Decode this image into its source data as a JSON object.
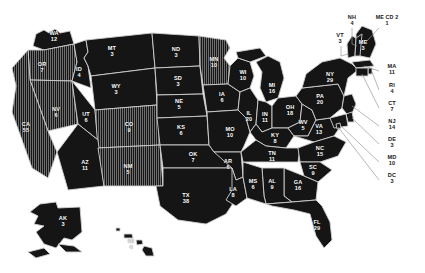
{
  "map": {
    "title": "United States Electoral College Map",
    "background_color": "#ffffff",
    "state_fill_solid": "#151515",
    "state_fill_hatched": "#4a4a4a",
    "state_border_color": "#cfcfcf",
    "label_color": "#ffffff",
    "outside_label_color": "#1a1a1a",
    "leader_line_color": "#9a9a9a"
  },
  "chart_data": {
    "type": "map",
    "value_label": "Electoral Votes",
    "units": "electoral votes",
    "regions": [
      {
        "code": "WA",
        "label": "WA",
        "value": 12,
        "x": 54,
        "y": 37,
        "style": "solid",
        "placement": "inside"
      },
      {
        "code": "OR",
        "label": "OR",
        "value": 7,
        "x": 42,
        "y": 68,
        "style": "hatched",
        "placement": "inside"
      },
      {
        "code": "CA",
        "label": "CA",
        "value": 55,
        "x": 26,
        "y": 128,
        "style": "hatched",
        "placement": "inside"
      },
      {
        "code": "NV",
        "label": "NV",
        "value": 6,
        "x": 56,
        "y": 113,
        "style": "hatched",
        "placement": "inside"
      },
      {
        "code": "ID",
        "label": "ID",
        "value": 4,
        "x": 79,
        "y": 73,
        "style": "solid",
        "placement": "inside"
      },
      {
        "code": "MT",
        "label": "MT",
        "value": 3,
        "x": 112,
        "y": 52,
        "style": "solid",
        "placement": "inside"
      },
      {
        "code": "WY",
        "label": "WY",
        "value": 3,
        "x": 116,
        "y": 90,
        "style": "solid",
        "placement": "inside"
      },
      {
        "code": "UT",
        "label": "UT",
        "value": 6,
        "x": 86,
        "y": 118,
        "style": "solid",
        "placement": "inside"
      },
      {
        "code": "CO",
        "label": "CO",
        "value": 9,
        "x": 129,
        "y": 128,
        "style": "hatched",
        "placement": "inside"
      },
      {
        "code": "AZ",
        "label": "AZ",
        "value": 11,
        "x": 85,
        "y": 166,
        "style": "solid",
        "placement": "inside"
      },
      {
        "code": "NM",
        "label": "NM",
        "value": 5,
        "x": 128,
        "y": 170,
        "style": "hatched",
        "placement": "inside"
      },
      {
        "code": "ND",
        "label": "ND",
        "value": 3,
        "x": 176,
        "y": 53,
        "style": "solid",
        "placement": "inside"
      },
      {
        "code": "SD",
        "label": "SD",
        "value": 3,
        "x": 178,
        "y": 82,
        "style": "solid",
        "placement": "inside"
      },
      {
        "code": "NE",
        "label": "NE",
        "value": 5,
        "x": 179,
        "y": 105,
        "style": "solid",
        "placement": "inside"
      },
      {
        "code": "KS",
        "label": "KS",
        "value": 6,
        "x": 181,
        "y": 131,
        "style": "solid",
        "placement": "inside"
      },
      {
        "code": "OK",
        "label": "OK",
        "value": 7,
        "x": 193,
        "y": 158,
        "style": "solid",
        "placement": "inside"
      },
      {
        "code": "TX",
        "label": "TX",
        "value": 38,
        "x": 186,
        "y": 199,
        "style": "solid",
        "placement": "inside"
      },
      {
        "code": "MN",
        "label": "MN",
        "value": 10,
        "x": 214,
        "y": 63,
        "style": "hatched",
        "placement": "inside"
      },
      {
        "code": "IA",
        "label": "IA",
        "value": 6,
        "x": 222,
        "y": 98,
        "style": "solid",
        "placement": "inside"
      },
      {
        "code": "MO",
        "label": "MO",
        "value": 10,
        "x": 230,
        "y": 133,
        "style": "solid",
        "placement": "inside"
      },
      {
        "code": "AR",
        "label": "AR",
        "value": 6,
        "x": 228,
        "y": 165,
        "style": "solid",
        "placement": "inside"
      },
      {
        "code": "LA",
        "label": "LA",
        "value": 8,
        "x": 233,
        "y": 193,
        "style": "solid",
        "placement": "inside"
      },
      {
        "code": "WI",
        "label": "WI",
        "value": 10,
        "x": 243,
        "y": 76,
        "style": "solid",
        "placement": "inside"
      },
      {
        "code": "IL",
        "label": "IL",
        "value": 20,
        "x": 249,
        "y": 117,
        "style": "solid",
        "placement": "inside"
      },
      {
        "code": "MS",
        "label": "MS",
        "value": 6,
        "x": 253,
        "y": 185,
        "style": "solid",
        "placement": "inside"
      },
      {
        "code": "MI",
        "label": "MI",
        "value": 16,
        "x": 272,
        "y": 89,
        "style": "solid",
        "placement": "inside"
      },
      {
        "code": "IN",
        "label": "IN",
        "value": 11,
        "x": 265,
        "y": 118,
        "style": "solid",
        "placement": "inside"
      },
      {
        "code": "KY",
        "label": "KY",
        "value": 8,
        "x": 275,
        "y": 139,
        "style": "solid",
        "placement": "inside"
      },
      {
        "code": "TN",
        "label": "TN",
        "value": 11,
        "x": 272,
        "y": 157,
        "style": "solid",
        "placement": "inside"
      },
      {
        "code": "AL",
        "label": "AL",
        "value": 9,
        "x": 272,
        "y": 185,
        "style": "solid",
        "placement": "inside"
      },
      {
        "code": "OH",
        "label": "OH",
        "value": 18,
        "x": 290,
        "y": 111,
        "style": "solid",
        "placement": "inside"
      },
      {
        "code": "WV",
        "label": "WV",
        "value": 5,
        "x": 303,
        "y": 126,
        "style": "solid",
        "placement": "inside"
      },
      {
        "code": "GA",
        "label": "GA",
        "value": 16,
        "x": 298,
        "y": 186,
        "style": "solid",
        "placement": "inside"
      },
      {
        "code": "VA",
        "label": "VA",
        "value": 13,
        "x": 319,
        "y": 130,
        "style": "solid",
        "placement": "inside"
      },
      {
        "code": "NC",
        "label": "NC",
        "value": 15,
        "x": 320,
        "y": 152,
        "style": "solid",
        "placement": "inside"
      },
      {
        "code": "SC",
        "label": "SC",
        "value": 9,
        "x": 313,
        "y": 171,
        "style": "solid",
        "placement": "inside"
      },
      {
        "code": "FL",
        "label": "FL",
        "value": 29,
        "x": 317,
        "y": 226,
        "style": "solid",
        "placement": "inside"
      },
      {
        "code": "PA",
        "label": "PA",
        "value": 20,
        "x": 320,
        "y": 100,
        "style": "solid",
        "placement": "inside"
      },
      {
        "code": "NY",
        "label": "NY",
        "value": 29,
        "x": 330,
        "y": 78,
        "style": "solid",
        "placement": "inside"
      },
      {
        "code": "ME",
        "label": "ME",
        "value": 3,
        "x": 363,
        "y": 46,
        "style": "solid",
        "placement": "inside"
      },
      {
        "code": "AK",
        "label": "AK",
        "value": 3,
        "x": 63,
        "y": 222,
        "style": "solid",
        "placement": "inside"
      },
      {
        "code": "HI",
        "label": "HI",
        "value": 4,
        "x": 131,
        "y": 245,
        "style": "solid",
        "placement": "inside"
      },
      {
        "code": "NH",
        "label": "NH",
        "value": 4,
        "x": 352,
        "y": 21,
        "style": "callout",
        "placement": "outside"
      },
      {
        "code": "ME-CD-2",
        "label": "ME CD 2",
        "value": 1,
        "x": 387,
        "y": 21,
        "style": "callout",
        "placement": "outside"
      },
      {
        "code": "VT",
        "label": "VT",
        "value": 3,
        "x": 340,
        "y": 39,
        "style": "callout",
        "placement": "outside"
      },
      {
        "code": "MA",
        "label": "MA",
        "value": 11,
        "x": 392,
        "y": 70,
        "style": "callout",
        "placement": "outside"
      },
      {
        "code": "RI",
        "label": "RI",
        "value": 4,
        "x": 392,
        "y": 89,
        "style": "callout",
        "placement": "outside"
      },
      {
        "code": "CT",
        "label": "CT",
        "value": 7,
        "x": 392,
        "y": 107,
        "style": "callout",
        "placement": "outside"
      },
      {
        "code": "NJ",
        "label": "NJ",
        "value": 14,
        "x": 392,
        "y": 125,
        "style": "callout",
        "placement": "outside"
      },
      {
        "code": "DE",
        "label": "DE",
        "value": 3,
        "x": 392,
        "y": 143,
        "style": "callout",
        "placement": "outside"
      },
      {
        "code": "MD",
        "label": "MD",
        "value": 10,
        "x": 392,
        "y": 161,
        "style": "callout",
        "placement": "outside"
      },
      {
        "code": "DC",
        "label": "DC",
        "value": 3,
        "x": 392,
        "y": 179,
        "style": "callout",
        "placement": "outside"
      }
    ]
  }
}
